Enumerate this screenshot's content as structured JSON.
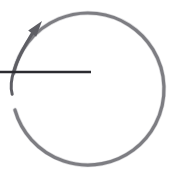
{
  "figure": {
    "canvas": {
      "width": 175,
      "height": 177,
      "background_color": "#ffffff"
    },
    "elements": [
      {
        "name": "rotation-arc",
        "kind": "arc",
        "color": "#6e6e72",
        "stroke_width": 3.2,
        "center": [
          88,
          89
        ],
        "radius": 76,
        "start_angle_deg": 168,
        "sweep_deg": 332,
        "direction": "counterclockwise",
        "gap_deg": 28
      },
      {
        "name": "direction-arrowhead",
        "kind": "arrowhead",
        "color": "#5e5e64",
        "tip": [
          42,
          21
        ],
        "pointing_deg": 52,
        "length": 16,
        "half_width": 5
      },
      {
        "name": "radius-line",
        "kind": "line",
        "color": "#2b2b30",
        "stroke_width": 2.6,
        "start": [
          0,
          72
        ],
        "end": [
          91,
          72
        ]
      }
    ]
  },
  "colors": {
    "arc_gray": "#6e6e72",
    "arrow_gray": "#5e5e64",
    "line_dark": "#2b2b30",
    "background": "#ffffff"
  }
}
